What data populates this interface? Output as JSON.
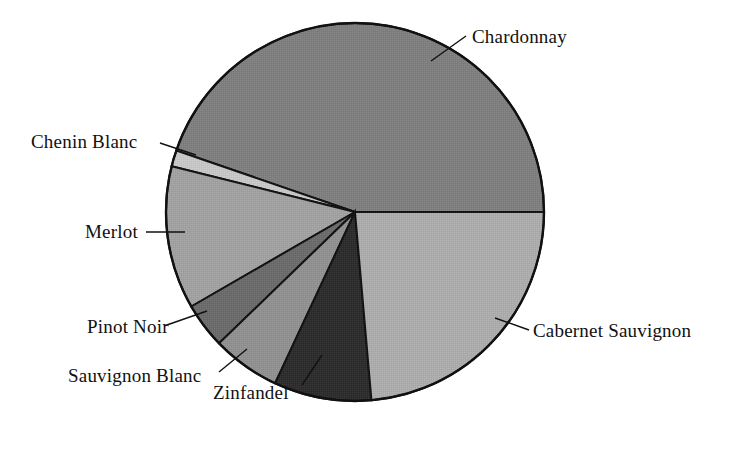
{
  "chart_data": {
    "type": "pie",
    "title": "",
    "subtitle": "",
    "xlabel": "",
    "ylabel": "",
    "legend_position": "none",
    "labels_position": "outside-with-leader-lines",
    "grid": false,
    "categories": [
      "Chardonnay",
      "Cabernet Sauvignon",
      "Zinfandel",
      "Sauvignon Blanc",
      "Pinot Noir",
      "Merlot",
      "Chenin Blanc"
    ],
    "values": [
      44.7,
      23.6,
      8.3,
      5.8,
      3.9,
      12.3,
      1.4
    ],
    "units": "percent",
    "slices": [
      {
        "name": "Chardonnay",
        "value": 44.7,
        "start_angle": 0,
        "end_angle": 161,
        "color": "#7f7f7f",
        "label": "Chardonnay"
      },
      {
        "name": "Chenin Blanc",
        "value": 1.4,
        "start_angle": 161,
        "end_angle": 166,
        "color": "#c8c8c8",
        "label": "Chenin Blanc"
      },
      {
        "name": "Merlot",
        "value": 12.3,
        "start_angle": 166,
        "end_angle": 210,
        "color": "#a2a2a2",
        "label": "Merlot"
      },
      {
        "name": "Pinot Noir",
        "value": 3.9,
        "start_angle": 210,
        "end_angle": 224,
        "color": "#6b6b6b",
        "label": "Pinot Noir"
      },
      {
        "name": "Sauvignon Blanc",
        "value": 5.8,
        "start_angle": 224,
        "end_angle": 245,
        "color": "#919191",
        "label": "Sauvignon Blanc"
      },
      {
        "name": "Zinfandel",
        "value": 8.3,
        "start_angle": 245,
        "end_angle": 275,
        "color": "#2c2c2c",
        "label": "Zinfandel"
      },
      {
        "name": "Cabernet Sauvignon",
        "value": 23.6,
        "start_angle": 275,
        "end_angle": 360,
        "color": "#adadad",
        "label": "Cabernet Sauvignon"
      }
    ],
    "geometry": {
      "center_x": 355,
      "center_y": 212,
      "radius": 189,
      "stroke": "#111111",
      "stroke_width": 2,
      "background": "#ffffff"
    }
  },
  "labels": {
    "chardonnay": "Chardonnay",
    "cabernet_sauvignon": "Cabernet Sauvignon",
    "chenin_blanc": "Chenin Blanc",
    "merlot": "Merlot",
    "pinot_noir": "Pinot Noir",
    "sauvignon_blanc": "Sauvignon Blanc",
    "zinfandel": "Zinfandel"
  }
}
